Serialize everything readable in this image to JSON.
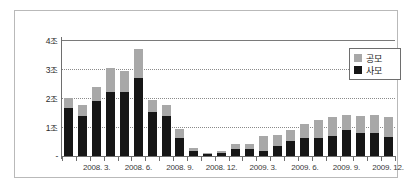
{
  "chart_data": {
    "type": "bar",
    "stacked": true,
    "title": "",
    "xlabel": "",
    "ylabel": "",
    "ylim": [
      0,
      4
    ],
    "yunit": "조",
    "grid": true,
    "legend_position": "top-right",
    "y_ticks": [
      "-",
      "1조",
      "2조",
      "3조",
      "4조"
    ],
    "y_tick_values": [
      0,
      1,
      2,
      3,
      4
    ],
    "categories": [
      "2008.1",
      "2008.2",
      "2008.3",
      "2008.4",
      "2008.5",
      "2008.6",
      "2008.7",
      "2008.8",
      "2008.9",
      "2008.10",
      "2008.11",
      "2008.12",
      "2009.1",
      "2009.2",
      "2009.3",
      "2009.4",
      "2009.5",
      "2009.6",
      "2009.7",
      "2009.8",
      "2009.9",
      "2009.10",
      "2009.11",
      "2009.12"
    ],
    "x_tick_labels": [
      "2008. 3.",
      "2008. 6.",
      "2008. 9.",
      "2008. 12.",
      "2009. 3.",
      "2009. 6.",
      "2009. 9.",
      "2009. 12."
    ],
    "x_tick_label_indices": [
      2,
      5,
      8,
      11,
      14,
      17,
      20,
      23
    ],
    "series": [
      {
        "name": "사모",
        "color": "#161616",
        "values": [
          1.65,
          1.38,
          1.9,
          2.2,
          2.22,
          2.7,
          1.53,
          1.37,
          0.62,
          0.19,
          0.08,
          0.12,
          0.24,
          0.23,
          0.19,
          0.33,
          0.52,
          0.63,
          0.62,
          0.68,
          0.88,
          0.8,
          0.78,
          0.67
        ]
      },
      {
        "name": "공모",
        "color": "#a8a8a8",
        "values": [
          0.35,
          0.38,
          0.48,
          0.85,
          0.7,
          1.0,
          0.4,
          0.38,
          0.3,
          0.07,
          0.03,
          0.06,
          0.18,
          0.18,
          0.5,
          0.4,
          0.38,
          0.48,
          0.62,
          0.66,
          0.53,
          0.58,
          0.65,
          0.67
        ]
      }
    ],
    "totals": [
      2.0,
      1.76,
      2.38,
      3.05,
      2.92,
      3.7,
      1.93,
      1.75,
      0.92,
      0.26,
      0.11,
      0.18,
      0.42,
      0.41,
      0.69,
      0.73,
      0.9,
      1.11,
      1.24,
      1.34,
      1.41,
      1.38,
      1.43,
      1.34
    ]
  },
  "legend": {
    "items": [
      {
        "label": "공모",
        "color": "#a8a8a8"
      },
      {
        "label": "사모",
        "color": "#161616"
      }
    ]
  }
}
